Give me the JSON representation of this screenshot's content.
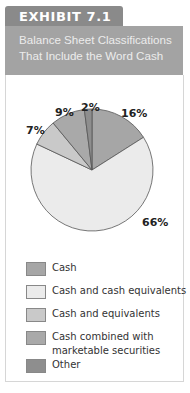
{
  "exhibit": {
    "label": "EXHIBIT 7.1",
    "title_line1": "Balance Sheet Classifications",
    "title_line2": "That Include the Word Cash"
  },
  "colors": {
    "tab": "#8a8a8a",
    "title_bg": "#a3a3a3",
    "cash": "#a6a6a6",
    "cash_and_cash_equivalents": "#ebebeb",
    "cash_and_equivalents": "#c9c9c9",
    "cash_combined": "#a9a9a9",
    "other": "#8e8e8e"
  },
  "chart_data": {
    "type": "pie",
    "title": "Balance Sheet Classifications That Include the Word Cash",
    "categories": [
      "Cash",
      "Cash and cash equivalents",
      "Cash and equivalents",
      "Cash combined with marketable securities",
      "Other"
    ],
    "values": [
      16,
      66,
      7,
      9,
      2
    ],
    "labels": [
      "16%",
      "66%",
      "7%",
      "9%",
      "2%"
    ],
    "legend_position": "bottom",
    "start_angle": "12 o'clock, clockwise"
  },
  "legend": [
    {
      "label": "Cash"
    },
    {
      "label": "Cash and cash equivalents"
    },
    {
      "label": "Cash and equivalents"
    },
    {
      "label": "Cash combined with",
      "label2": "marketable securities"
    },
    {
      "label": "Other"
    }
  ]
}
